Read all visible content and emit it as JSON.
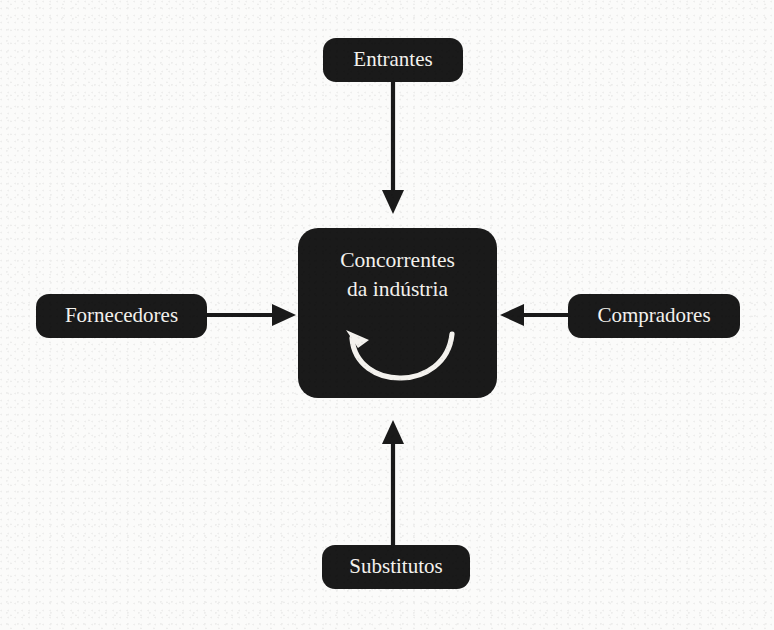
{
  "diagram": {
    "type": "porters-five-forces",
    "background_color": "#fbfbfa",
    "node_fill_color": "#1a1a1a",
    "node_text_color": "#f4f2ee",
    "connector_color": "#1a1a1a",
    "center": {
      "label_line1": "Concorrentes",
      "label_line2": "da indústria",
      "rivalry_icon": "circular-arrow-icon"
    },
    "nodes": [
      {
        "id": "entrantes",
        "label": "Entrantes",
        "position": "top",
        "arrow_direction": "down",
        "arrow_points_to": "center"
      },
      {
        "id": "fornecedores",
        "label": "Fornecedores",
        "position": "left",
        "arrow_direction": "right",
        "arrow_points_to": "center"
      },
      {
        "id": "compradores",
        "label": "Compradores",
        "position": "right",
        "arrow_direction": "left",
        "arrow_points_to": "center"
      },
      {
        "id": "substitutos",
        "label": "Substitutos",
        "position": "bottom",
        "arrow_direction": "up",
        "arrow_points_to": "center"
      }
    ]
  }
}
